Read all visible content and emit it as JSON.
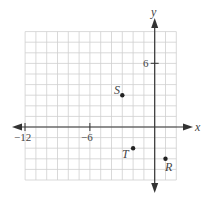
{
  "chart_data": {
    "type": "scatter",
    "title": "",
    "xlabel": "x",
    "ylabel": "y",
    "grid": true,
    "xlim": [
      -12,
      2
    ],
    "ylim": [
      -5,
      9
    ],
    "x_tick_labels": [
      {
        "value": -12,
        "label": "−12"
      },
      {
        "value": -6,
        "label": "−6"
      }
    ],
    "y_tick_labels": [
      {
        "value": 6,
        "label": "6"
      }
    ],
    "points": [
      {
        "name": "S",
        "x": -3,
        "y": 3
      },
      {
        "name": "T",
        "x": -2,
        "y": -2
      },
      {
        "name": "R",
        "x": 1,
        "y": -3
      }
    ]
  },
  "axes": {
    "x_label": "x",
    "y_label": "y",
    "tick_neg12": "−12",
    "tick_neg6": "−6",
    "tick_6": "6"
  },
  "points": {
    "S": "S",
    "T": "T",
    "R": "R"
  },
  "colors": {
    "grid": "#cfcfcf",
    "axis": "#333333",
    "point": "#222222"
  }
}
